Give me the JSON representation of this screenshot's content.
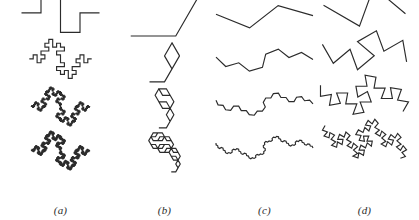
{
  "figure": {
    "background_color": "#ffffff",
    "stroke_color": "#2b2b2b",
    "width": 419,
    "height": 220,
    "type": "fractal-curve-iteration-grid",
    "rows": 4,
    "columns": 4,
    "row_labels": [
      "stage 1",
      "stage 2",
      "stage 3",
      "stage 4"
    ]
  },
  "panels": [
    {
      "id": "a",
      "label": "(a)",
      "name": "quadratic-koch-square-bump",
      "left": 8,
      "generator_angles": [
        0,
        90,
        0,
        -90,
        -90,
        0,
        90,
        0
      ],
      "iterations": [
        1,
        2,
        3,
        4
      ],
      "scale": [
        0.98,
        0.95,
        0.95,
        0.95
      ],
      "baseline": [
        0.72,
        0.74,
        0.8,
        0.8
      ],
      "curve_color": "#2b2b2b"
    },
    {
      "id": "b",
      "label": "(b)",
      "name": "koch-triangular-bump",
      "left": 112,
      "generator_angles": [
        0,
        60,
        -120,
        60
      ],
      "iterations": [
        1,
        2,
        3,
        4
      ],
      "scale": [
        1.0,
        1.0,
        1.0,
        1.0
      ],
      "baseline": [
        0.8,
        0.82,
        0.84,
        0.84
      ],
      "curve_color": "#2b2b2b"
    },
    {
      "id": "c",
      "label": "(c)",
      "name": "shallow-zigzag-random-walk",
      "left": 212,
      "generator_angles": [
        -22,
        38,
        -16
      ],
      "iterations": [
        1,
        2,
        3,
        4
      ],
      "scale": [
        1.0,
        1.0,
        1.0,
        1.0
      ],
      "baseline": [
        0.62,
        0.58,
        0.56,
        0.55
      ],
      "curve_color": "#2b2b2b"
    },
    {
      "id": "d",
      "label": "(d)",
      "name": "steep-zigzag-random-walk",
      "left": 312,
      "generator_angles": [
        -30,
        70,
        -40
      ],
      "iterations": [
        1,
        2,
        3,
        4
      ],
      "scale": [
        1.0,
        1.0,
        1.0,
        1.0
      ],
      "baseline": [
        0.58,
        0.55,
        0.54,
        0.54
      ],
      "curve_color": "#2b2b2b"
    }
  ],
  "chart_data": {
    "type": "line",
    "title": "",
    "xlabel": "",
    "ylabel": "",
    "legend": [
      "(a)",
      "(b)",
      "(c)",
      "(d)"
    ],
    "grid": false,
    "series": [
      {
        "name": "(a)",
        "generator": "quadratic Koch square bump, 8 segments",
        "segments": 8,
        "turn_sequence_deg": [
          0,
          90,
          0,
          -90,
          -90,
          0,
          90,
          0
        ],
        "segment_length_ratio": 0.25,
        "fractal_dimension": 1.5,
        "stages": 4
      },
      {
        "name": "(b)",
        "generator": "Koch triangular bump, 4 segments",
        "segments": 4,
        "turn_sequence_deg": [
          0,
          60,
          -120,
          60
        ],
        "segment_length_ratio": 0.3333,
        "fractal_dimension": 1.2619,
        "stages": 4
      },
      {
        "name": "(c)",
        "generator": "shallow three-segment zigzag",
        "segments": 3,
        "turn_sequence_deg": [
          -22,
          38,
          -16
        ],
        "segment_length_ratio": 0.38,
        "fractal_dimension": 1.15,
        "stages": 4
      },
      {
        "name": "(d)",
        "generator": "steep three-segment zigzag",
        "segments": 3,
        "turn_sequence_deg": [
          -30,
          70,
          -40
        ],
        "segment_length_ratio": 0.4,
        "fractal_dimension": 1.35,
        "stages": 4
      }
    ]
  }
}
